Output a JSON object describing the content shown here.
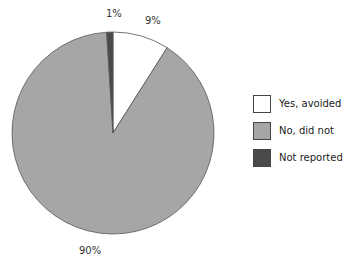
{
  "chart_data": {
    "type": "pie",
    "title": "",
    "categories": [
      "Yes, avoided",
      "No, did not",
      "Not reported"
    ],
    "values": [
      9,
      90,
      1
    ],
    "labels": [
      "9%",
      "90%",
      "1%"
    ],
    "colors": [
      "#ffffff",
      "#a6a6a6",
      "#4a4a4a"
    ],
    "start_angle_deg": 0,
    "direction": "clockwise",
    "legend_position": "right"
  },
  "legend": {
    "items": [
      {
        "label": "Yes, avoided",
        "color": "#ffffff"
      },
      {
        "label": "No, did not",
        "color": "#a6a6a6"
      },
      {
        "label": "Not reported",
        "color": "#4a4a4a"
      }
    ]
  }
}
